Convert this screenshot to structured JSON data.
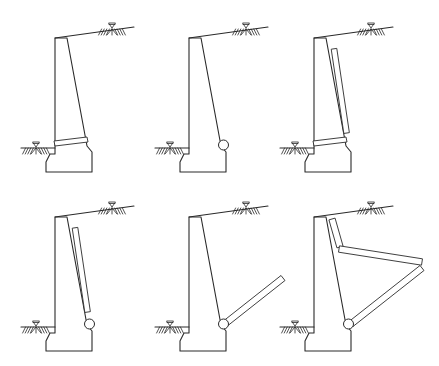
{
  "figure": {
    "title": "",
    "colors": {
      "line": "#2a2a2a",
      "background": "#ffffff"
    },
    "panels": [
      {
        "id": "a",
        "drainage": "through-wall weep hole band at base",
        "has_pipe": false,
        "has_back_board": false,
        "has_base_band": true,
        "has_inclined_drain": false,
        "has_horizontal_drain": false
      },
      {
        "id": "b",
        "drainage": "drain pipe at heel",
        "has_pipe": true,
        "has_back_board": false,
        "has_base_band": false,
        "has_inclined_drain": false,
        "has_horizontal_drain": false
      },
      {
        "id": "c",
        "drainage": "back-face drainage board with base weep band",
        "has_pipe": false,
        "has_back_board": true,
        "has_base_band": true,
        "has_inclined_drain": false,
        "has_horizontal_drain": false
      },
      {
        "id": "d",
        "drainage": "back-face drainage board with drain pipe",
        "has_pipe": true,
        "has_back_board": true,
        "has_base_band": false,
        "has_inclined_drain": false,
        "has_horizontal_drain": false
      },
      {
        "id": "e",
        "drainage": "inclined drain with pipe",
        "has_pipe": true,
        "has_back_board": false,
        "has_base_band": false,
        "has_inclined_drain": true,
        "has_horizontal_drain": false
      },
      {
        "id": "f",
        "drainage": "back board, horizontal drain and inclined drain with pipe",
        "has_pipe": true,
        "has_back_board": true,
        "has_base_band": false,
        "has_inclined_drain": true,
        "has_horizontal_drain": true
      }
    ],
    "symbols": {
      "water_level": "inverted-triangle",
      "ground": "hatched-soil"
    }
  }
}
